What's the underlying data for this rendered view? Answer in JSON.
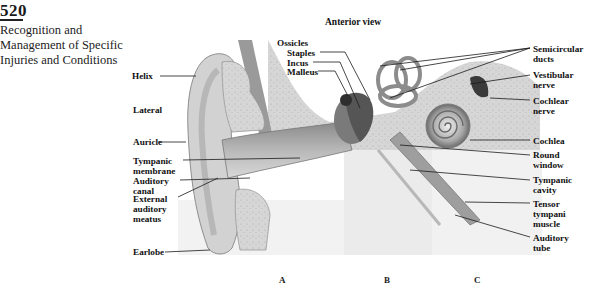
{
  "page": {
    "number": "520",
    "running_head": [
      "Recognition and",
      "Management of Specific",
      "Injuries and Conditions"
    ]
  },
  "figure": {
    "view_title": "Anterior view",
    "panels": [
      "A",
      "B",
      "C"
    ],
    "left_labels": {
      "helix": "Helix",
      "lateral": "Lateral",
      "auricle": "Auricle",
      "tympanic_membrane": [
        "Tympanic",
        "membrane"
      ],
      "auditory_canal": [
        "Auditory",
        "canal"
      ],
      "external_auditory_meatus": [
        "External",
        "auditory",
        "meatus"
      ],
      "earlobe": "Earlobe"
    },
    "ossicle_labels": {
      "group": "Ossicles",
      "staples": "Staples",
      "incus": "Incus",
      "malleus": "Malleus"
    },
    "right_labels": {
      "semicircular_ducts": [
        "Semicircular",
        "ducts"
      ],
      "vestibular_nerve": [
        "Vestibular",
        "nerve"
      ],
      "cochlear_nerve": [
        "Cochlear",
        "nerve"
      ],
      "cochlea": "Cochlea",
      "round_window": [
        "Round",
        "window"
      ],
      "tympanic_cavity": [
        "Tympanic",
        "cavity"
      ],
      "tensor_tympani_muscle": [
        "Tensor",
        "tympani",
        "muscle"
      ],
      "auditory_tube": [
        "Auditory",
        "tube"
      ]
    },
    "colors": {
      "tissue_light": "#e4e4e4",
      "tissue_mid": "#bdbdbd",
      "tissue_dark": "#6e6e6e",
      "bone_speckle": "#cfcfcf",
      "leader_line": "#1a1a1a"
    }
  }
}
